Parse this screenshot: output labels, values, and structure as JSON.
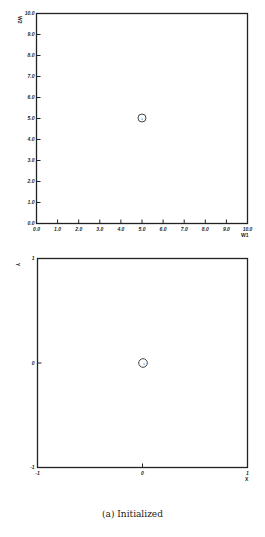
{
  "chart_data": [
    {
      "type": "scatter",
      "title": "",
      "xlabel": "W1",
      "ylabel": "W2",
      "xlim": [
        0.0,
        10.0
      ],
      "ylim": [
        0.0,
        10.0
      ],
      "xticks": [
        "0.0",
        "1.0",
        "2.0",
        "3.0",
        "4.0",
        "5.0",
        "6.0",
        "7.0",
        "8.0",
        "9.0",
        "10.0"
      ],
      "yticks": [
        "0.0",
        "1.0",
        "2.0",
        "3.0",
        "4.0",
        "5.0",
        "6.0",
        "7.0",
        "8.0",
        "9.0",
        "10.0"
      ],
      "grid": false,
      "points": [
        {
          "x": 5.0,
          "y": 5.0,
          "label": "1",
          "marker": "circle"
        }
      ]
    },
    {
      "type": "scatter",
      "title": "",
      "xlabel": "X",
      "ylabel": "Y",
      "xlim": [
        -1,
        1
      ],
      "ylim": [
        -1,
        1
      ],
      "xticks": [
        "-1",
        "0",
        "1"
      ],
      "yticks": [
        "-1",
        "0",
        "1"
      ],
      "grid": false,
      "points": [
        {
          "x": 0,
          "y": 0,
          "label": "1",
          "marker": "circle"
        }
      ]
    }
  ],
  "caption": "(a) Initialized",
  "plot1": {
    "xlabel": "W1",
    "ylabel": "W2",
    "point_label": "1"
  },
  "plot2": {
    "xlabel": "X",
    "ylabel": "Y",
    "point_label": "1"
  }
}
